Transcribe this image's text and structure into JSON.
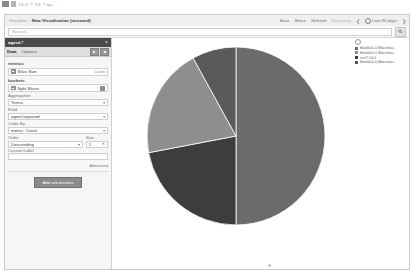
{
  "chrome": {
    "tab_text": "15,5 ? 16 ? qu..."
  },
  "topnav": {
    "breadcrumb_root": "Visualize",
    "breadcrumb_sep": "/",
    "breadcrumb_current": "New Visualization (unsaved)",
    "actions": [
      "Save",
      "Share",
      "Refresh"
    ],
    "reporting_label": "Reporting",
    "prev_arrow": "❮",
    "next_arrow": "❯",
    "time_range": "Last 30 days"
  },
  "query": {
    "placeholder": "Search...",
    "search_button_icon": "search-icon"
  },
  "sidebar": {
    "title": "agent.*",
    "close_icon": "close-icon",
    "tabs": [
      {
        "label": "Data",
        "active": true
      },
      {
        "label": "Options",
        "active": false
      }
    ],
    "tab_buttons": [
      "collapse-button",
      "apply-button"
    ],
    "metrics_label": "metrics",
    "metric_row": {
      "icon": "bar-icon",
      "label": "Slice Size",
      "value": "Count"
    },
    "buckets_label": "buckets",
    "bucket_row": {
      "icon": "bar-icon",
      "label": "Split Slices",
      "chevron": "‹"
    },
    "aggregation_label": "Aggregation",
    "aggregation_value": "Terms",
    "field_label": "Field",
    "field_value": "agent.keyword",
    "order_by_label": "Order By",
    "order_by_value": "metric: Count",
    "order_label": "Order",
    "order_value": "Descending",
    "size_label": "Size",
    "size_value": "5",
    "custom_label_label": "Custom Label",
    "custom_label_value": "",
    "advanced_label": "Advanced",
    "add_button": "Add sub-buckets",
    "caret": "▾"
  },
  "legend": {
    "toggle_icon": "legend-toggle-icon",
    "items": [
      {
        "label": "Mozilla/5.0 (Macintos...",
        "color": "#6b6b6b"
      },
      {
        "label": "Mozilla/5.0 (Macintos...",
        "color": "#8e8e8e"
      },
      {
        "label": "curl/7.54.0",
        "color": "#3d3d3d"
      },
      {
        "label": "Mozilla/5.0 (Macintos...",
        "color": "#575757"
      }
    ]
  },
  "chart_data": {
    "type": "pie",
    "title": "",
    "labels": [
      "Mozilla/5.0 (Macintosh; Intel Mac OS X) A",
      "Mozilla/5.0 (Macintosh; Intel Mac OS X) B",
      "curl/7.54.0",
      "Mozilla/5.0 (Macintosh; Intel Mac OS X) C"
    ],
    "values": [
      50,
      22,
      20,
      8
    ],
    "colors": [
      "#6b6b6b",
      "#3d3d3d",
      "#8e8e8e",
      "#5a5a5a"
    ],
    "start_angle": 0,
    "legend_position": "right",
    "donut": false
  }
}
